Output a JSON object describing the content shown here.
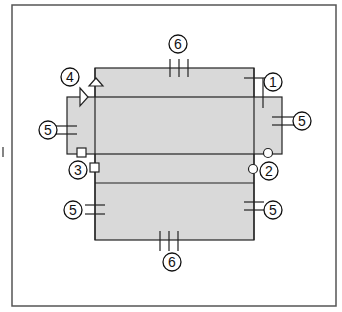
{
  "diagram": {
    "type": "component-assembly-callouts",
    "colors": {
      "background": "#ffffff",
      "frame": "#555555",
      "panel_fill": "#d9d9d9",
      "stroke": "#222222"
    },
    "callouts": [
      {
        "id": "c1",
        "label": "1"
      },
      {
        "id": "c2",
        "label": "2"
      },
      {
        "id": "c3",
        "label": "3"
      },
      {
        "id": "c4",
        "label": "4"
      },
      {
        "id": "c5a",
        "label": "5"
      },
      {
        "id": "c5b",
        "label": "5"
      },
      {
        "id": "c5c",
        "label": "5"
      },
      {
        "id": "c5d",
        "label": "5"
      },
      {
        "id": "c6a",
        "label": "6"
      },
      {
        "id": "c6b",
        "label": "6"
      }
    ],
    "side_mark": "I"
  }
}
